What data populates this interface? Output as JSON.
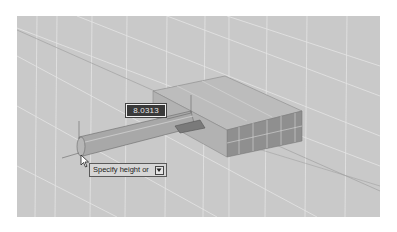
{
  "viewport": {
    "background": "#c9c9c9",
    "page_background": "#ffffff"
  },
  "scene": {
    "objects": [
      {
        "type": "box",
        "name": "solid-box",
        "top_color": "#bdbdbd",
        "front_color": "#8e8e8e",
        "side_color": "#a4a4a4"
      },
      {
        "type": "cylinder",
        "name": "cylinder-in-progress",
        "color": "#a9a9a9"
      }
    ],
    "grid_color": "#e6e6e6"
  },
  "dynamic_input": {
    "value": "8.0313"
  },
  "tooltip": {
    "prompt": "Specify height or",
    "options_icon": "down-arrow-icon"
  },
  "cursor": {
    "icon": "crosshair-pointer-icon"
  }
}
